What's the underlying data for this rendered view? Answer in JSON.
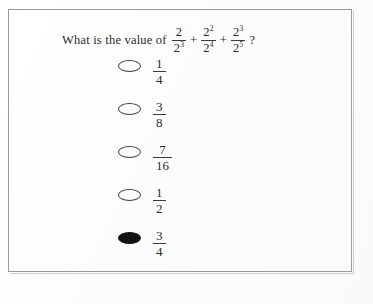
{
  "page": {
    "background_color": "#fdfdfd",
    "frame_color": "#9a9a9a"
  },
  "question": {
    "stem_text": "What is the value of",
    "question_mark": "?",
    "operators": [
      "+",
      "+"
    ],
    "terms": [
      {
        "numerator": "2",
        "numerator_exponent": "",
        "denominator": "2",
        "denominator_exponent": "3"
      },
      {
        "numerator": "2",
        "numerator_exponent": "2",
        "denominator": "2",
        "denominator_exponent": "4"
      },
      {
        "numerator": "2",
        "numerator_exponent": "3",
        "denominator": "2",
        "denominator_exponent": "5"
      }
    ]
  },
  "options": [
    {
      "numerator": "1",
      "denominator": "4",
      "selected": false
    },
    {
      "numerator": "3",
      "denominator": "8",
      "selected": false
    },
    {
      "numerator": "7",
      "denominator": "16",
      "selected": false
    },
    {
      "numerator": "1",
      "denominator": "2",
      "selected": false
    },
    {
      "numerator": "3",
      "denominator": "4",
      "selected": true
    }
  ]
}
